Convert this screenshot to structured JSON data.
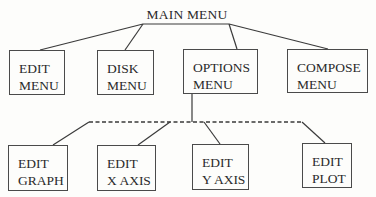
{
  "diagram": {
    "root": {
      "label": "MAIN MENU"
    },
    "level1": [
      {
        "id": "edit-menu",
        "line1": "EDIT",
        "line2": "MENU"
      },
      {
        "id": "disk-menu",
        "line1": "DISK",
        "line2": "MENU"
      },
      {
        "id": "options-menu",
        "line1": "OPTIONS",
        "line2": "MENU"
      },
      {
        "id": "compose-menu",
        "line1": "COMPOSE",
        "line2": "MENU"
      }
    ],
    "level2_parent": "OPTIONS MENU",
    "level2": [
      {
        "id": "edit-graph",
        "line1": "EDIT",
        "line2": "GRAPH"
      },
      {
        "id": "edit-x-axis",
        "line1": "EDIT",
        "line2": "X AXIS"
      },
      {
        "id": "edit-y-axis",
        "line1": "EDIT",
        "line2": "Y AXIS"
      },
      {
        "id": "edit-plot",
        "line1": "EDIT",
        "line2": "PLOT"
      }
    ]
  }
}
